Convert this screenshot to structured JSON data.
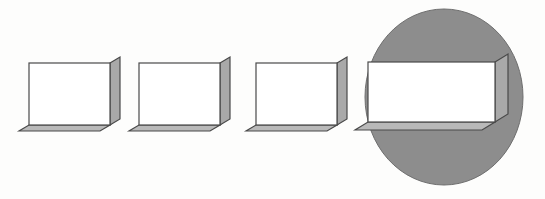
{
  "figure": {
    "background_color": "#fdfdfc",
    "width": 545,
    "height": 199
  },
  "palette": {
    "box_front_fill": "#ffffff",
    "box_side_fill": "#a9a9a9",
    "box_bottom_fill": "#b9b9b9",
    "box_outline": "#4a4a4a",
    "magnifier_fill": "#8d8d8d",
    "magnifier_outline": "#6e6e6e",
    "background": "#fdfdfc"
  },
  "geometry": {
    "extrude_dx": 10,
    "extrude_dy": -6,
    "outline_width": 1.2
  },
  "shapes": [
    {
      "name": "box-1",
      "label": "Box 1",
      "kind": "extruded-box",
      "x": 29,
      "y": 63,
      "w": 81,
      "h": 62,
      "dx": 10,
      "dy": -6,
      "magnified": false
    },
    {
      "name": "box-2",
      "label": "Box 2",
      "kind": "extruded-box",
      "x": 139,
      "y": 63,
      "w": 81,
      "h": 62,
      "dx": 10,
      "dy": -6,
      "magnified": false
    },
    {
      "name": "box-3",
      "label": "Box 3",
      "kind": "extruded-box",
      "x": 256,
      "y": 63,
      "w": 81,
      "h": 62,
      "dx": 10,
      "dy": -6,
      "magnified": false
    },
    {
      "name": "box-4",
      "label": "Box 4",
      "kind": "extruded-box",
      "x": 368,
      "y": 62,
      "w": 127,
      "h": 60,
      "dx": 13,
      "dy": -8,
      "magnified": true
    }
  ],
  "magnifier": {
    "name": "magnifier-ellipse",
    "label": "Magnifier",
    "cx": 444,
    "cy": 97,
    "rx": 79,
    "ry": 88,
    "fill": "#8d8d8d",
    "stroke": "#6e6e6e"
  },
  "accessibility": {
    "alt_text": "Four identical three-dimensional rectangular boxes drawn in a row from left to right. Each box has a white front face, a gray right side face and a gray bottom face. The fourth box on the right is shown enlarged inside a large gray circle, as if viewed through a magnifying lens."
  }
}
